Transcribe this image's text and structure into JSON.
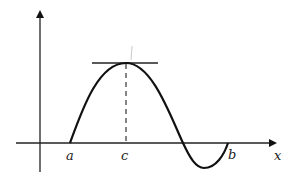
{
  "diagram": {
    "axis_labels": {
      "x": "x"
    },
    "points": [
      {
        "name": "a",
        "label": "a"
      },
      {
        "name": "c",
        "label": "c"
      },
      {
        "name": "b",
        "label": "b"
      }
    ],
    "colors": {
      "stroke": "#111111",
      "dashed": "#333333",
      "background": "#ffffff"
    }
  }
}
